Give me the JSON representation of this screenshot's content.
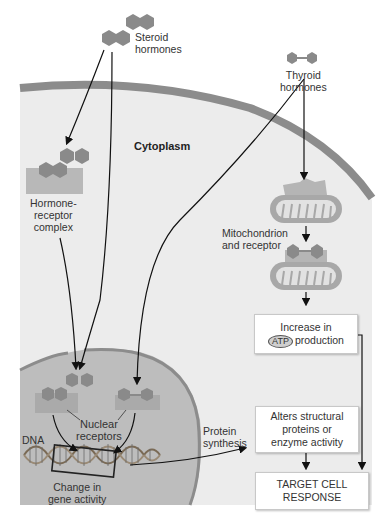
{
  "labels": {
    "steroid_hormones": [
      "Steroid",
      "hormones"
    ],
    "thyroid_hormones": [
      "Thyroid",
      "hormones"
    ],
    "cytoplasm": "Cytoplasm",
    "hormone_receptor_complex": [
      "Hormone-",
      "receptor",
      "complex"
    ],
    "mitochondrion_and_receptor": [
      "Mitochondrion",
      "and receptor"
    ],
    "nuclear_receptors": [
      "Nuclear",
      "receptors"
    ],
    "dna": "DNA",
    "change_in_gene_activity": [
      "Change in",
      "gene activity"
    ],
    "protein_synthesis": [
      "Protein",
      "synthesis"
    ]
  },
  "boxes": {
    "atp": {
      "line1": "Increase in",
      "badge": "ATP",
      "line2": "production"
    },
    "alters": [
      "Alters structural",
      "proteins or",
      "enzyme activity"
    ],
    "response": [
      "TARGET CELL",
      "RESPONSE"
    ]
  },
  "colors": {
    "membrane": "#8c8c8c",
    "cytoplasm": "#ececec",
    "nucleus": "#bdbdbd",
    "hormone": "#8a8a8a",
    "receptor": "#b0b0b0",
    "mitochondrion": "#a8a8a8",
    "arrow": "#111111"
  }
}
